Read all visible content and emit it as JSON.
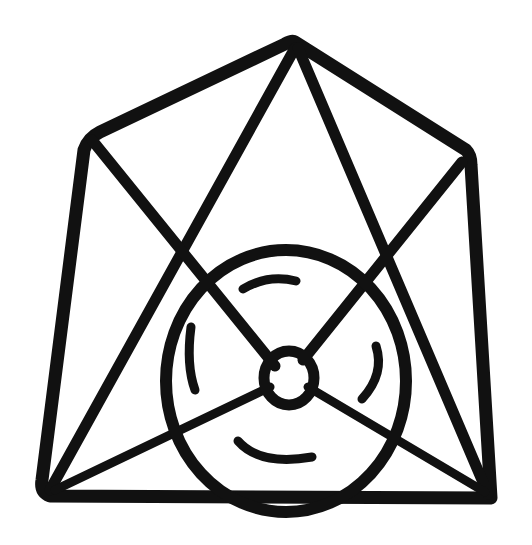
{
  "image": {
    "description": "Black line drawing of a polyhedral frame with a circle containing a small hub connected by spokes, with four curved arc marks inside the circle",
    "colors": {
      "ink": "#111111",
      "background": "#ffffff"
    }
  }
}
